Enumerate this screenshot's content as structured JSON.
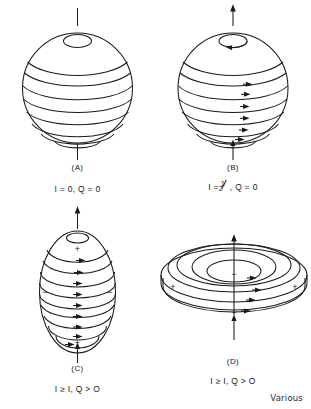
{
  "figure": {
    "caption_note": "Various",
    "background": "#ffffff",
    "ink_color": "#1a1a1a"
  },
  "panels": [
    {
      "id": "A",
      "label": "(A)",
      "shape": "sphere",
      "caption": "I = 0, Q = 0",
      "spin_value": "0",
      "quadrupole_value": "0",
      "has_spin_arrow": false,
      "has_rotation_arrows": false,
      "charge_signs": []
    },
    {
      "id": "B",
      "label": "(B)",
      "shape": "sphere",
      "caption_prefix": "I =",
      "caption_fraction_numerator": "1",
      "caption_fraction_denominator": "2",
      "caption_suffix": ", Q = 0",
      "spin_value": "1/2",
      "quadrupole_value": "0",
      "has_spin_arrow": true,
      "has_rotation_arrows": true,
      "charge_signs": []
    },
    {
      "id": "C",
      "label": "(C)",
      "shape": "prolate-spheroid",
      "caption": "I ≥ I, Q > O",
      "spin_value": "≥ 1",
      "quadrupole_value": "> 0",
      "has_spin_arrow": true,
      "has_rotation_arrows": true,
      "charge_signs": [
        {
          "sign": "+",
          "position": "north-pole"
        },
        {
          "sign": "−",
          "position": "equator-left"
        },
        {
          "sign": "−",
          "position": "equator-right"
        },
        {
          "sign": "+",
          "position": "south-pole"
        }
      ]
    },
    {
      "id": "D",
      "label": "(D)",
      "shape": "oblate-spheroid",
      "caption": "I ≥ I, Q > O",
      "spin_value": "≥ 1",
      "quadrupole_value": "> 0",
      "has_spin_arrow": true,
      "has_rotation_arrows": true,
      "charge_signs": [
        {
          "sign": "−",
          "position": "polar-top"
        },
        {
          "sign": "+",
          "position": "equator-left"
        },
        {
          "sign": "+",
          "position": "equator-right"
        },
        {
          "sign": "−",
          "position": "polar-bottom"
        }
      ]
    }
  ]
}
